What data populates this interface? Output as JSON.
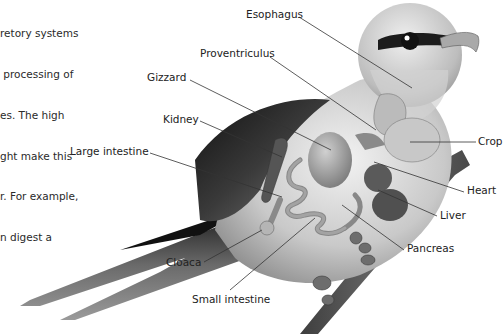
{
  "intro_text": {
    "lines": [
      "retory systems",
      " processing of",
      "es. The high",
      "ght make this",
      "r. For example,",
      "n digest a"
    ]
  },
  "diagram": {
    "labels": [
      {
        "id": "esophagus",
        "text": "Esophagus"
      },
      {
        "id": "proventriculus",
        "text": "Proventriculus"
      },
      {
        "id": "gizzard",
        "text": "Gizzard"
      },
      {
        "id": "kidney",
        "text": "Kidney"
      },
      {
        "id": "large-intestine",
        "text": "Large intestine"
      },
      {
        "id": "crop",
        "text": "Crop"
      },
      {
        "id": "heart",
        "text": "Heart"
      },
      {
        "id": "liver",
        "text": "Liver"
      },
      {
        "id": "pancreas",
        "text": "Pancreas"
      },
      {
        "id": "cloaca",
        "text": "Cloaca"
      },
      {
        "id": "small-intestine",
        "text": "Small intestine"
      }
    ]
  },
  "colors": {
    "background": "#ffffff",
    "text": "#222222",
    "leader_line": "#333333",
    "bird_light": "#e2e2e2",
    "bird_mid": "#a8a8a8",
    "bird_dark": "#2e2e2e"
  }
}
